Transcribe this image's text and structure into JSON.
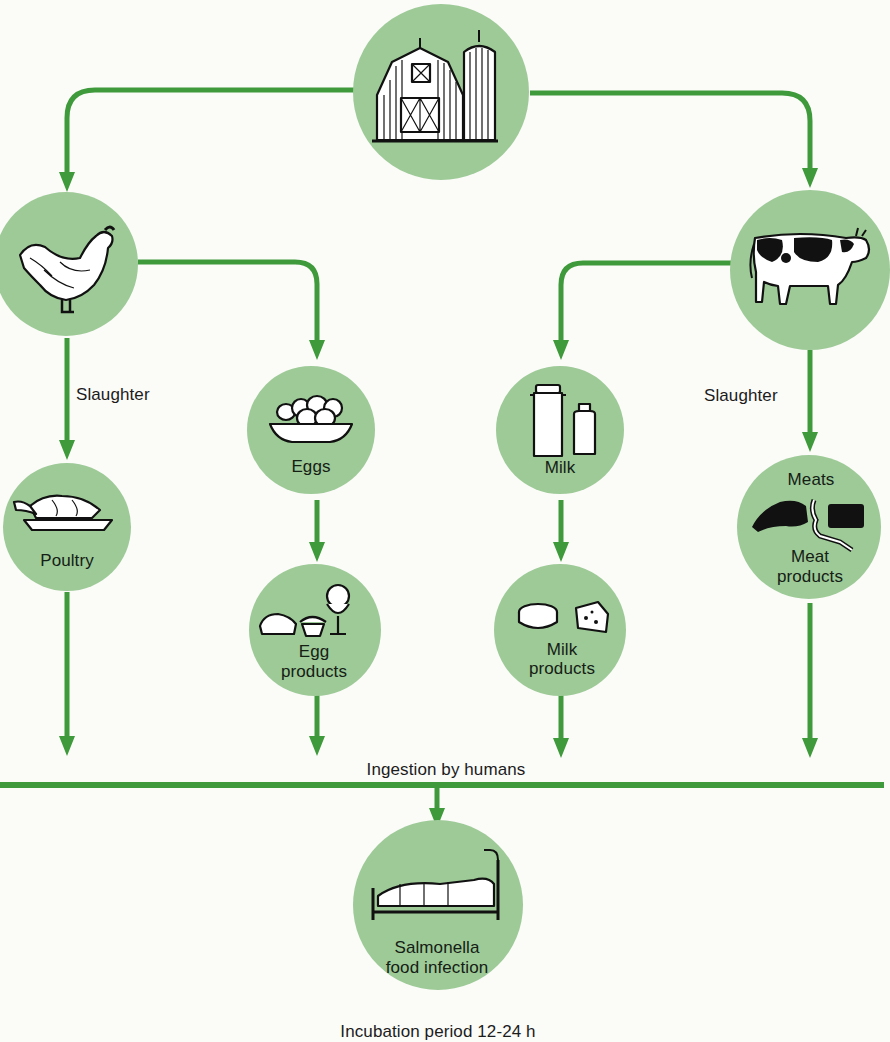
{
  "diagram": {
    "colors": {
      "node_fill": "#9dca97",
      "arrow": "#3e9a3a",
      "background": "#fbfbf8",
      "text": "#1c1c1c"
    },
    "nodes": {
      "farm": {
        "icon": "barn-silo-icon",
        "label": ""
      },
      "chicken": {
        "icon": "chicken-icon",
        "label": ""
      },
      "cow": {
        "icon": "cow-icon",
        "label": ""
      },
      "poultry": {
        "icon": "roast-poultry-icon",
        "label": "Poultry"
      },
      "eggs": {
        "icon": "egg-bowl-icon",
        "label": "Eggs"
      },
      "milk": {
        "icon": "milk-can-bottle-icon",
        "label": "Milk"
      },
      "meats": {
        "icon": "meat-cuts-icon",
        "label_top": "Meats",
        "label_bottom_1": "Meat",
        "label_bottom_2": "products"
      },
      "egg_products": {
        "icon": "desserts-icon",
        "label_1": "Egg",
        "label_2": "products"
      },
      "milk_products": {
        "icon": "cheese-icon",
        "label_1": "Milk",
        "label_2": "products"
      },
      "infection": {
        "icon": "sickbed-icon",
        "label_1": "Salmonella",
        "label_2": "food infection"
      }
    },
    "edge_labels": {
      "poultry_slaughter": "Slaughter",
      "cattle_slaughter": "Slaughter",
      "ingestion": "Ingestion by humans",
      "incubation": "Incubation period 12-24 h"
    },
    "edges": [
      {
        "from": "farm",
        "to": "chicken"
      },
      {
        "from": "farm",
        "to": "cow"
      },
      {
        "from": "chicken",
        "to": "poultry",
        "label": "Slaughter"
      },
      {
        "from": "chicken",
        "to": "eggs"
      },
      {
        "from": "cow",
        "to": "milk"
      },
      {
        "from": "cow",
        "to": "meats",
        "label": "Slaughter"
      },
      {
        "from": "eggs",
        "to": "egg_products"
      },
      {
        "from": "milk",
        "to": "milk_products"
      },
      {
        "from": "poultry",
        "to": "ingestion"
      },
      {
        "from": "egg_products",
        "to": "ingestion"
      },
      {
        "from": "milk_products",
        "to": "ingestion"
      },
      {
        "from": "meats",
        "to": "ingestion"
      },
      {
        "from": "ingestion",
        "to": "infection"
      }
    ]
  }
}
